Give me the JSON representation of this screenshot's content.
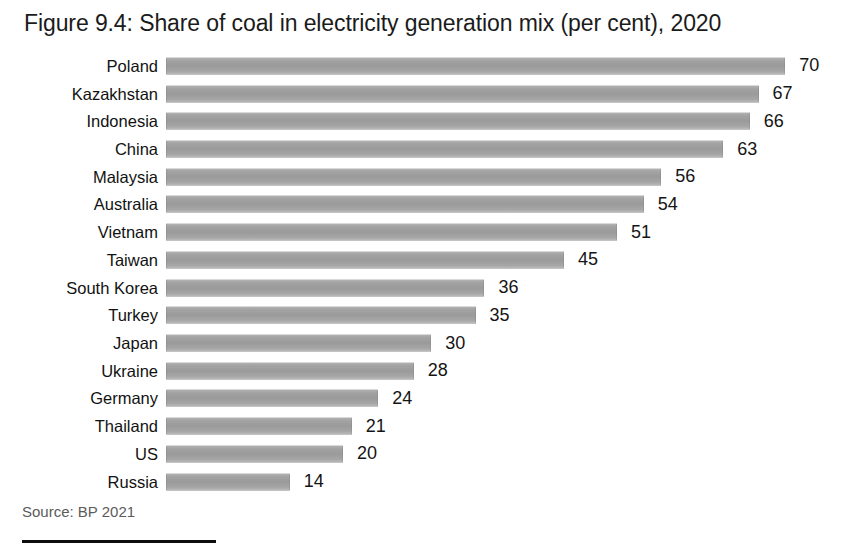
{
  "figure": {
    "title": "Figure 9.4: Share of coal in electricity generation mix (per cent), 2020",
    "source_note": "Source: BP 2021"
  },
  "colors": {
    "bar_fill": "#9a9a9a",
    "bar_fill_light": "#b4b4b4",
    "title_text": "#1b1b1b",
    "label_text": "#121212",
    "value_text": "#151515",
    "source_text": "#5b5b5b",
    "rule": "#0d0d0d",
    "background": "#ffffff"
  },
  "chart_data": {
    "type": "bar",
    "orientation": "horizontal",
    "title": "Figure 9.4: Share of coal in electricity generation mix (per cent), 2020",
    "xlabel": "",
    "ylabel": "",
    "unit": "per cent",
    "year": "2020",
    "grid": false,
    "legend": false,
    "axis_visible": false,
    "data_labels": true,
    "xlim": [
      0,
      70
    ],
    "sorted": "descending",
    "categories": [
      "Poland",
      "Kazakhstan",
      "Indonesia",
      "China",
      "Malaysia",
      "Australia",
      "Vietnam",
      "Taiwan",
      "South Korea",
      "Turkey",
      "Japan",
      "Ukraine",
      "Germany",
      "Thailand",
      "US",
      "Russia"
    ],
    "values": [
      70,
      67,
      66,
      63,
      56,
      54,
      51,
      45,
      36,
      35,
      30,
      28,
      24,
      21,
      20,
      14
    ],
    "value_labels": [
      "70",
      "67",
      "66",
      "63",
      "56",
      "54",
      "51",
      "45",
      "36",
      "35",
      "30",
      "28",
      "24",
      "21",
      "20",
      "14"
    ],
    "series": [
      {
        "name": "Share of coal in electricity generation mix (per cent)",
        "values": [
          70,
          67,
          66,
          63,
          56,
          54,
          51,
          45,
          36,
          35,
          30,
          28,
          24,
          21,
          20,
          14
        ]
      }
    ],
    "source": "BP 2021"
  }
}
